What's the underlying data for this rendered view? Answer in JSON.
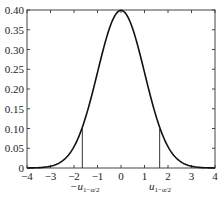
{
  "chart_data": {
    "type": "line",
    "title": "",
    "xlabel": "",
    "ylabel": "",
    "xlim": [
      -4,
      4
    ],
    "ylim": [
      0,
      0.4
    ],
    "grid": false,
    "legend": null,
    "xticks": [
      -4,
      -3,
      -2,
      -1,
      0,
      1,
      2,
      3,
      4
    ],
    "xtick_labels": [
      "−4",
      "−3",
      "−2",
      "−1",
      "0",
      "1",
      "2",
      "3",
      "4"
    ],
    "yticks": [
      0,
      0.05,
      0.1,
      0.15,
      0.2,
      0.25,
      0.3,
      0.35,
      0.4
    ],
    "ytick_labels": [
      "0",
      "0.05",
      "0.10",
      "0.15",
      "0.20",
      "0.25",
      "0.30",
      "0.35",
      "0.40"
    ],
    "series": [
      {
        "name": "standard normal density",
        "function": "exp(-x^2/2)/sqrt(2*pi)",
        "x": [
          -4,
          -3.5,
          -3,
          -2.5,
          -2,
          -1.645,
          -1.5,
          -1,
          -0.5,
          0,
          0.5,
          1,
          1.5,
          1.645,
          2,
          2.5,
          3,
          3.5,
          4
        ],
        "y": [
          0.0001,
          0.0009,
          0.0044,
          0.0175,
          0.054,
          0.103,
          0.1295,
          0.242,
          0.352,
          0.399,
          0.352,
          0.242,
          0.1295,
          0.103,
          0.054,
          0.0175,
          0.0044,
          0.0009,
          0.0001
        ]
      }
    ],
    "annotations": [
      {
        "type": "vline",
        "x": -1.645,
        "y_top": 0.103,
        "label": "−u",
        "subscript": "1−α/2"
      },
      {
        "type": "vline",
        "x": 1.645,
        "y_top": 0.103,
        "label": "u",
        "subscript": "1−α/2"
      }
    ]
  },
  "labels": {
    "left_crit_main": "−u",
    "left_crit_sub": "1−α/2",
    "right_crit_main": "u",
    "right_crit_sub": "1−α/2"
  },
  "style": {
    "curve_color": "#111111",
    "axis_color": "#444444",
    "line_color": "#333333"
  }
}
